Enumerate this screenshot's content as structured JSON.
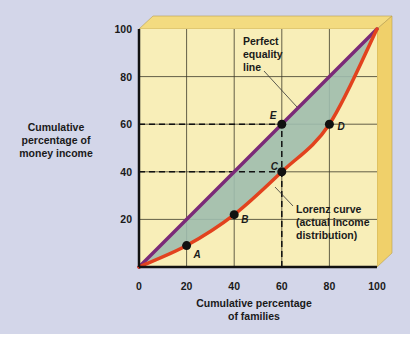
{
  "chart_data": {
    "type": "line",
    "title": "",
    "xlabel": "Cumulative percentage of families",
    "xlabel_lines": [
      "Cumulative percentage",
      "of families"
    ],
    "ylabel": "Cumulative percentage of money income",
    "ylabel_lines": [
      "Cumulative",
      "percentage of",
      "money income"
    ],
    "xlim": [
      0,
      100
    ],
    "ylim": [
      0,
      100
    ],
    "x_ticks": [
      0,
      20,
      40,
      60,
      80,
      100
    ],
    "y_ticks": [
      20,
      40,
      60,
      80,
      100
    ],
    "x_tick_labels": [
      "0",
      "20",
      "40",
      "60",
      "80",
      "100"
    ],
    "y_tick_labels": [
      "20",
      "40",
      "60",
      "80",
      "100"
    ],
    "grid": true,
    "series": [
      {
        "name": "Perfect equality line",
        "color": "#7b2a78",
        "x": [
          0,
          100
        ],
        "y": [
          0,
          100
        ]
      },
      {
        "name": "Lorenz curve (actual income distribution)",
        "color": "#e2421e",
        "x": [
          0,
          20,
          40,
          60,
          80,
          100
        ],
        "y": [
          0,
          9,
          22,
          40,
          60,
          100
        ]
      }
    ],
    "points": [
      {
        "label": "A",
        "x": 20,
        "y": 9
      },
      {
        "label": "B",
        "x": 40,
        "y": 22
      },
      {
        "label": "C",
        "x": 60,
        "y": 40
      },
      {
        "label": "D",
        "x": 80,
        "y": 60
      },
      {
        "label": "E",
        "x": 60,
        "y": 60
      }
    ],
    "annotations": [
      {
        "text": "Perfect equality line",
        "lines": [
          "Perfect",
          "equality",
          "line"
        ]
      },
      {
        "text": "Lorenz curve (actual income distribution)",
        "lines": [
          "Lorenz curve",
          "(actual income",
          "distribution)"
        ]
      }
    ],
    "reference_lines": [
      {
        "type": "horizontal",
        "y": 60,
        "x_to": 60,
        "style": "dashed"
      },
      {
        "type": "horizontal",
        "y": 40,
        "x_to": 60,
        "style": "dashed"
      },
      {
        "type": "vertical",
        "x": 60,
        "y_from": 0,
        "y_to": 60,
        "style": "dashed"
      }
    ],
    "colors": {
      "plot_background": "#f8eeb8",
      "frame_3d": "#f3db80",
      "shaded_area": "#9ebcae",
      "page_background": "#d3d6e9"
    }
  }
}
